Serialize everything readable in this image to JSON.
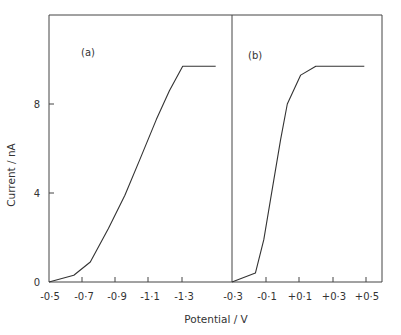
{
  "chart_data": {
    "type": "line",
    "xlabel": "Potential / V",
    "ylabel": "Current / nA",
    "grid": false,
    "legend": null,
    "y_ticks": [
      "0",
      "4",
      "8"
    ],
    "ylim": [
      0,
      11.7
    ],
    "panels": [
      {
        "label": "(a)",
        "x_ticks": [
          "-0·5",
          "-0·7",
          "-0·9",
          "-1·1",
          "-1·3"
        ],
        "xlim": [
          -0.5,
          -1.5
        ],
        "series": [
          {
            "name": "(a)",
            "x": [
              -0.5,
              -0.65,
              -0.75,
              -0.86,
              -0.96,
              -1.05,
              -1.15,
              -1.23,
              -1.31,
              -1.51
            ],
            "y": [
              0,
              0.3,
              0.9,
              2.4,
              3.9,
              5.5,
              7.3,
              8.6,
              9.7,
              9.7
            ]
          }
        ]
      },
      {
        "label": "(b)",
        "x_ticks": [
          "-0·3",
          "-0·1",
          "+0·1",
          "+0·3",
          "+0·5"
        ],
        "xlim": [
          -0.3,
          0.6
        ],
        "series": [
          {
            "name": "(b)",
            "x": [
              -0.3,
              -0.16,
              -0.11,
              -0.07,
              -0.01,
              0.03,
              0.11,
              0.2,
              0.49
            ],
            "y": [
              0,
              0.4,
              1.9,
              3.7,
              6.4,
              8.0,
              9.3,
              9.7,
              9.7
            ]
          }
        ]
      }
    ]
  }
}
